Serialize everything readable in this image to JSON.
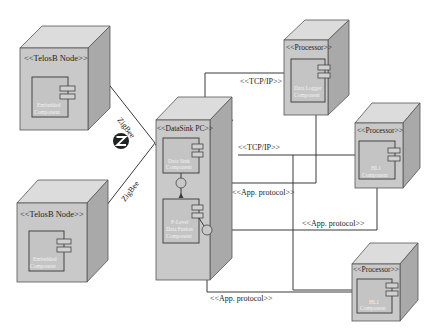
{
  "diagram": {
    "type": "UML deployment diagram",
    "nodes": [
      {
        "id": "telosb-1",
        "title": "<<TelosB Node>>",
        "component": [
          "Embedded",
          "Component"
        ]
      },
      {
        "id": "telosb-2",
        "title": "<<TelosB Node>>",
        "component": [
          "Embedded",
          "Component"
        ]
      },
      {
        "id": "datasink",
        "title": "<<DataSink PC>>",
        "components": [
          {
            "id": "data-sink",
            "label": [
              "Data Sink",
              "Component"
            ]
          },
          {
            "id": "data-fusion",
            "label": [
              "F-Level",
              "Data Fusion",
              "Component"
            ]
          }
        ]
      },
      {
        "id": "processor-1",
        "title": "<<Processor>>",
        "component": [
          "Data Logger",
          "Component"
        ]
      },
      {
        "id": "processor-2",
        "title": "<<Processor>>",
        "component": [
          "HL1",
          "Component"
        ]
      },
      {
        "id": "processor-3",
        "title": "<<Processor>>",
        "component": [
          "HL1",
          "Component"
        ]
      }
    ],
    "connections": {
      "zigbee_top": "ZigBee",
      "zigbee_bottom": "ZigBee",
      "tcp_top": "<<TCP/IP>>",
      "tcp_mid": "<<TCP/IP>>",
      "app_1": "<<App. protocol>>",
      "app_2": "<<App. protocol>>",
      "app_3": "<<App. protocol>>"
    },
    "logo": {
      "name": "zigbee-logo",
      "glyph": "Z",
      "color": "#222222"
    },
    "colors": {
      "node_front": "#c9c9c9",
      "node_top": "#dcdcdc",
      "node_side": "#a9a9a9",
      "line": "#3a3a3a"
    }
  }
}
